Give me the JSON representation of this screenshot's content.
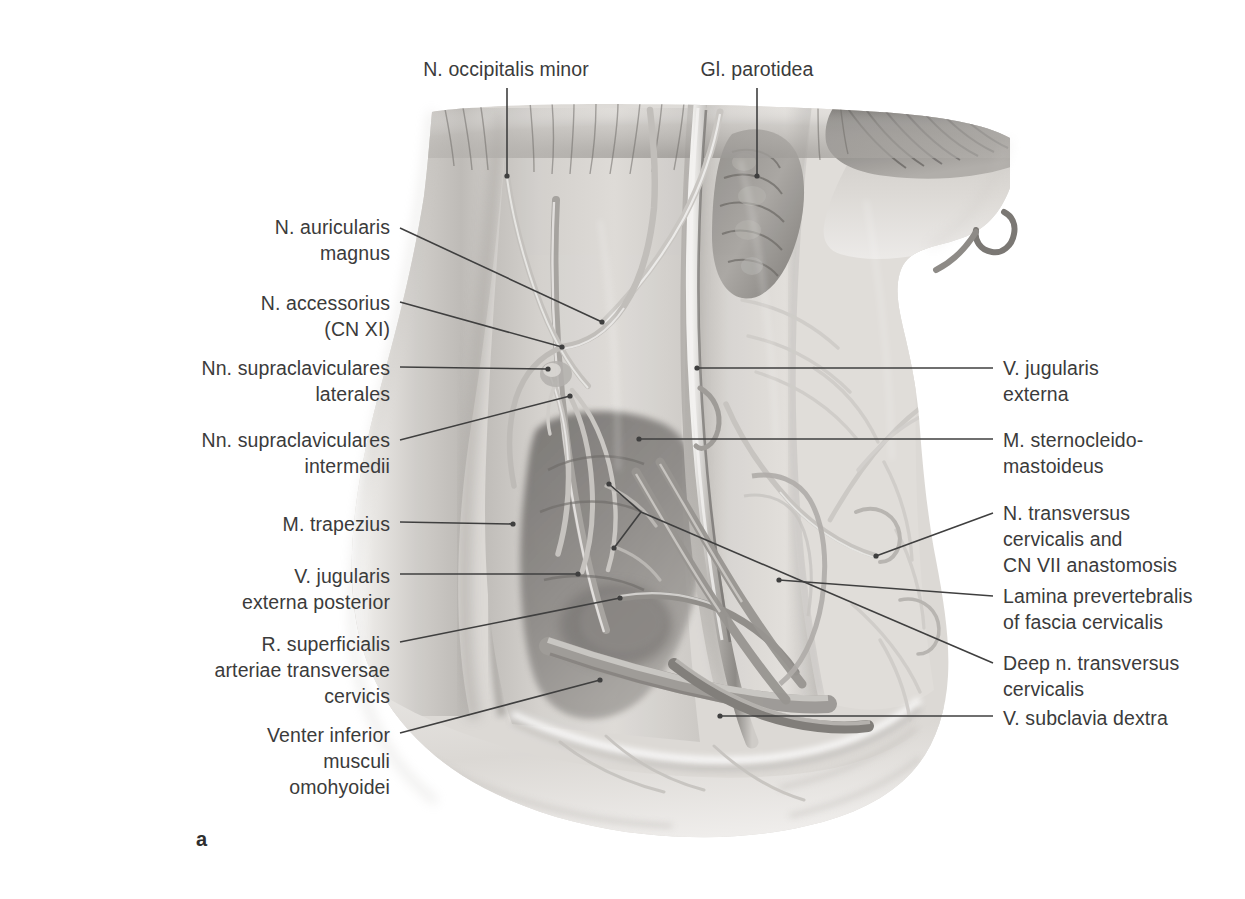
{
  "figure": {
    "letter": "a",
    "view": "Right lateral cervical region, superficial dissection",
    "background_color": "#ffffff",
    "ink_color": "#3b3b3b",
    "leader_color": "#3f3f3f"
  },
  "labels": {
    "top": [
      {
        "id": "n-occipitalis-minor",
        "text": "N. occipitalis minor",
        "align": "center",
        "x": 506,
        "y": 56,
        "width": 260,
        "leader": {
          "type": "vertical",
          "x1": 507,
          "y1": 88,
          "x2": 507,
          "y2": 176
        }
      },
      {
        "id": "gl-parotidea",
        "text": "Gl. parotidea",
        "align": "center",
        "x": 757,
        "y": 56,
        "width": 210,
        "leader": {
          "type": "vertical",
          "x1": 757,
          "y1": 88,
          "x2": 757,
          "y2": 176
        }
      }
    ],
    "left": [
      {
        "id": "n-auricularis-magnus",
        "text": "N. auricularis\nmagnus",
        "align": "right",
        "right": 990,
        "y": 214,
        "leader": {
          "type": "line",
          "x1": 400,
          "y1": 228,
          "x2": 602,
          "y2": 322
        }
      },
      {
        "id": "n-accessorius",
        "text": "N. accessorius\n(CN XI)",
        "align": "right",
        "right": 990,
        "y": 290,
        "leader": {
          "type": "line",
          "x1": 400,
          "y1": 302,
          "x2": 562,
          "y2": 347
        }
      },
      {
        "id": "nn-supraclaviculares-laterales",
        "text": "Nn. supraclaviculares\nlaterales",
        "align": "right",
        "right": 990,
        "y": 355,
        "leader": {
          "type": "line",
          "x1": 400,
          "y1": 367,
          "x2": 548,
          "y2": 369
        }
      },
      {
        "id": "nn-supraclaviculares-intermedii",
        "text": "Nn. supraclaviculares\nintermedii",
        "align": "right",
        "right": 990,
        "y": 427,
        "leader": {
          "type": "line",
          "x1": 400,
          "y1": 440,
          "x2": 570,
          "y2": 396
        }
      },
      {
        "id": "m-trapezius",
        "text": "M. trapezius",
        "align": "right",
        "right": 990,
        "y": 511,
        "leader": {
          "type": "line",
          "x1": 400,
          "y1": 522,
          "x2": 513,
          "y2": 524
        }
      },
      {
        "id": "v-jugularis-externa-posterior",
        "text": "V. jugularis\nexterna posterior",
        "align": "right",
        "right": 990,
        "y": 563,
        "leader": {
          "type": "line",
          "x1": 400,
          "y1": 574,
          "x2": 578,
          "y2": 574
        }
      },
      {
        "id": "r-superficialis-arteriae-transversae-cervicis",
        "text": "R. superficialis\narteriae transversae\ncervicis",
        "align": "right",
        "right": 990,
        "y": 631,
        "leader": {
          "type": "line",
          "x1": 400,
          "y1": 642,
          "x2": 620,
          "y2": 598
        }
      },
      {
        "id": "venter-inferior-musculi-omohyoidei",
        "text": "Venter inferior\nmusculi\nomohyoidei",
        "align": "right",
        "right": 990,
        "y": 722,
        "leader": {
          "type": "line",
          "x1": 400,
          "y1": 733,
          "x2": 600,
          "y2": 680
        }
      }
    ],
    "right": [
      {
        "id": "v-jugularis-externa",
        "text": "V. jugularis\nexterna",
        "align": "left",
        "left": 1003,
        "y": 355,
        "leader": {
          "type": "line",
          "x1": 993,
          "y1": 368,
          "x2": 697,
          "y2": 368
        }
      },
      {
        "id": "m-sternocleidomastoideus",
        "text": "M. sternocleido-\nmastoideus",
        "align": "left",
        "left": 1003,
        "y": 427,
        "leader": {
          "type": "line",
          "x1": 993,
          "y1": 439,
          "x2": 639,
          "y2": 439
        }
      },
      {
        "id": "n-transversus-cervicalis-cn-vii",
        "text": "N. transversus\ncervicalis and\nCN VII anastomosis",
        "align": "left",
        "left": 1003,
        "y": 500,
        "leader": {
          "type": "line",
          "x1": 993,
          "y1": 513,
          "x2": 876,
          "y2": 556
        }
      },
      {
        "id": "lamina-prevertebralis",
        "text": "Lamina prevertebralis\nof fascia cervicalis",
        "align": "left",
        "left": 1003,
        "y": 583,
        "leader": {
          "type": "line",
          "x1": 993,
          "y1": 596,
          "x2": 779,
          "y2": 580
        }
      },
      {
        "id": "deep-n-transversus-cervicalis",
        "text": "Deep n. transversus\ncervicalis",
        "align": "left",
        "left": 1003,
        "y": 650,
        "leader": {
          "type": "fork",
          "x1": 993,
          "y1": 663,
          "branch_x": 641,
          "branch_y": 512,
          "tip_a_x": 609,
          "tip_a_y": 484,
          "tip_b_x": 614,
          "tip_b_y": 548
        }
      },
      {
        "id": "v-subclavia-dextra",
        "text": "V. subclavia dextra",
        "align": "left",
        "left": 1003,
        "y": 705,
        "leader": {
          "type": "line",
          "x1": 993,
          "y1": 716,
          "x2": 720,
          "y2": 716
        }
      }
    ]
  },
  "illustration": {
    "description": "Grayscale airbrush/pencil anatomical rendering of the right lateral cervical region with superficial fascia removed, showing the posterior triangle of the neck.",
    "structures": [
      "N. occipitalis minor",
      "Gl. parotidea",
      "N. auricularis magnus",
      "N. accessorius (CN XI)",
      "Nn. supraclaviculares laterales",
      "Nn. supraclaviculares intermedii",
      "M. trapezius",
      "V. jugularis externa posterior",
      "R. superficialis arteriae transversae cervicis",
      "Venter inferior musculi omohyoidei",
      "V. jugularis externa",
      "M. sternocleidomastoideus",
      "N. transversus cervicalis and CN VII anastomosis",
      "Lamina prevertebralis of fascia cervicalis",
      "Deep n. transversus cervicalis",
      "V. subclavia dextra"
    ],
    "tones": {
      "skin_light": "#e4e2df",
      "skin_mid": "#c9c6c2",
      "fascia": "#b4b1ad",
      "muscle_dark": "#8d8a86",
      "deep_shadow": "#5e5c59",
      "vessel_edge": "#f3f2f0"
    }
  }
}
